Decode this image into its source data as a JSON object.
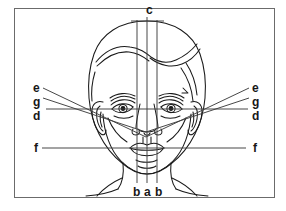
{
  "figure": {
    "frame": {
      "border_color": "#6b6b6b",
      "background": "#ffffff"
    },
    "line_color": "#1a1a1a",
    "guide_color": "#3d3d3d"
  },
  "labels": {
    "top": {
      "text": "c",
      "x": 146,
      "y": 4
    },
    "left": [
      {
        "text": "e",
        "x": 33,
        "y": 82
      },
      {
        "text": "g",
        "x": 33,
        "y": 96
      },
      {
        "text": "d",
        "x": 33,
        "y": 110
      },
      {
        "text": "f",
        "x": 34,
        "y": 142
      }
    ],
    "right": [
      {
        "text": "e",
        "x": 252,
        "y": 82
      },
      {
        "text": "g",
        "x": 252,
        "y": 96
      },
      {
        "text": "d",
        "x": 252,
        "y": 110
      },
      {
        "text": "f",
        "x": 253,
        "y": 142
      }
    ],
    "bottom": [
      {
        "text": "b",
        "x": 133,
        "y": 186
      },
      {
        "text": "a",
        "x": 143,
        "y": 186
      },
      {
        "text": "b",
        "x": 154,
        "y": 186
      }
    ]
  },
  "guides": {
    "vertical": [
      {
        "name": "b-left",
        "x": 137,
        "y1": 20,
        "y2": 183
      },
      {
        "name": "a-center",
        "x": 147,
        "y1": 17,
        "y2": 183
      },
      {
        "name": "b-right",
        "x": 157,
        "y1": 20,
        "y2": 183
      }
    ],
    "horizontal": [
      {
        "name": "c-top",
        "y": 21,
        "x1": 131,
        "x2": 164
      },
      {
        "name": "d-eye-line",
        "y": 109,
        "x1": 46,
        "x2": 248
      },
      {
        "name": "f-mouth-line",
        "y": 148,
        "x1": 42,
        "x2": 246
      }
    ],
    "diagonal": [
      {
        "name": "e-left",
        "x1": 43,
        "y1": 88,
        "x2": 146,
        "y2": 137
      },
      {
        "name": "e-right",
        "x1": 249,
        "y1": 88,
        "x2": 146,
        "y2": 137
      },
      {
        "name": "g-left",
        "x1": 43,
        "y1": 98,
        "x2": 146,
        "y2": 132
      },
      {
        "name": "g-right",
        "x1": 249,
        "y1": 98,
        "x2": 146,
        "y2": 132
      }
    ]
  },
  "legend_keys": [
    "a",
    "b",
    "c",
    "d",
    "e",
    "f",
    "g"
  ]
}
